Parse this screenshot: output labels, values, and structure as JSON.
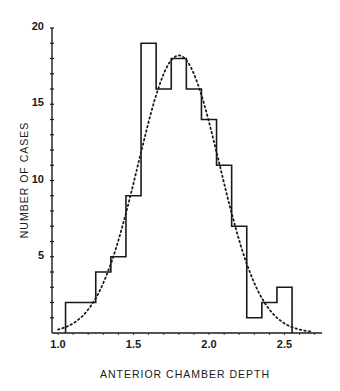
{
  "chart_data": {
    "type": "bar",
    "subtype": "histogram-with-fitted-normal-curve",
    "title": "",
    "xlabel": "ANTERIOR CHAMBER DEPTH",
    "ylabel": "NUMBER OF CASES",
    "xlim": [
      0.97,
      2.75
    ],
    "ylim": [
      0,
      20
    ],
    "xticks": [
      "1.0",
      "1.5",
      "2.0",
      "2.5"
    ],
    "yticks": [
      "5",
      "10",
      "15",
      "20"
    ],
    "grid": false,
    "legend": null,
    "bin_width": 0.1,
    "categories": [
      "1.1",
      "1.2",
      "1.3",
      "1.4",
      "1.5",
      "1.6",
      "1.7",
      "1.8",
      "1.9",
      "2.0",
      "2.1",
      "2.2",
      "2.3",
      "2.4",
      "2.5"
    ],
    "values": [
      2,
      2,
      4,
      5,
      9,
      19,
      16,
      18,
      16,
      14,
      11,
      7,
      1,
      2,
      3
    ],
    "series": [
      {
        "name": "Observed histogram",
        "style": "solid step outline",
        "values": [
          2,
          2,
          4,
          5,
          9,
          19,
          16,
          18,
          16,
          14,
          11,
          7,
          1,
          2,
          3
        ]
      },
      {
        "name": "Fitted normal curve",
        "style": "dotted",
        "mean": 1.8,
        "peak": 18.2,
        "sd": 0.27
      }
    ]
  },
  "labels": {
    "ylabel": "NUMBER OF CASES",
    "xlabel": "ANTERIOR CHAMBER DEPTH",
    "yticks": [
      {
        "label": "20",
        "value": 20
      },
      {
        "label": "15",
        "value": 15
      },
      {
        "label": "10",
        "value": 10
      },
      {
        "label": "5",
        "value": 5
      }
    ],
    "xticks": [
      {
        "label": "1.0",
        "value": 1.0
      },
      {
        "label": "1.5",
        "value": 1.5
      },
      {
        "label": "2.0",
        "value": 2.0
      },
      {
        "label": "2.5",
        "value": 2.5
      }
    ]
  },
  "colors": {
    "ink": "#1a1a1a",
    "background": "#ffffff"
  }
}
